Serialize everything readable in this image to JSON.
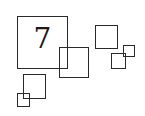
{
  "diagram": {
    "label": "7",
    "stroke_color": "#2a2a2a",
    "background": "#ffffff",
    "squares": [
      {
        "id": "large",
        "x": 17,
        "y": 16,
        "w": 51,
        "h": 53
      },
      {
        "id": "medium-overlap",
        "x": 59,
        "y": 47,
        "w": 30,
        "h": 31
      },
      {
        "id": "right-upper",
        "x": 95,
        "y": 25,
        "w": 23,
        "h": 24
      },
      {
        "id": "right-small",
        "x": 111,
        "y": 53,
        "w": 15,
        "h": 16
      },
      {
        "id": "right-tiny",
        "x": 123,
        "y": 45,
        "w": 12,
        "h": 12
      },
      {
        "id": "bottom-left",
        "x": 23,
        "y": 74,
        "w": 23,
        "h": 25
      },
      {
        "id": "bottom-left-tiny",
        "x": 17,
        "y": 93,
        "w": 13,
        "h": 14
      }
    ]
  }
}
